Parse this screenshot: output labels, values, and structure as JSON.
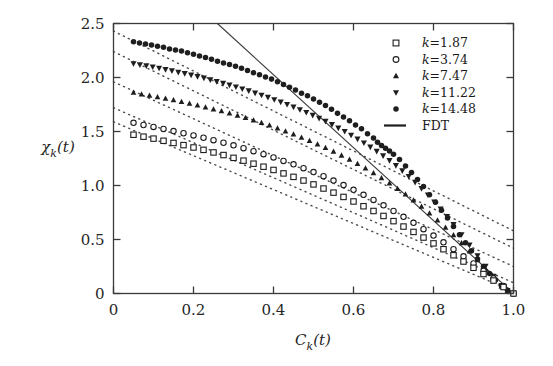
{
  "figure": {
    "background": "#ffffff",
    "ink_color": "#1a1a1a"
  },
  "axes": {
    "x_title": "C",
    "x_title_sub": "k",
    "x_title_tail": "(t)",
    "y_title": "χ",
    "y_title_sub": "k",
    "y_title_tail": "(t)",
    "x_ticks": [
      "0",
      "0.2",
      "0.4",
      "0.6",
      "0.8",
      "1.0"
    ],
    "x_tick_values": [
      0,
      0.2,
      0.4,
      0.6,
      0.8,
      1.0
    ],
    "y_ticks": [
      "0",
      "0.5",
      "1.0",
      "1.5",
      "2.0",
      "2.5"
    ],
    "y_tick_values": [
      0,
      0.5,
      1.0,
      1.5,
      2.0,
      2.5
    ],
    "xlim": [
      0,
      1.0
    ],
    "ylim": [
      0,
      2.5
    ],
    "grid": false
  },
  "legend": {
    "position": "top-right",
    "entries": [
      {
        "label_lhs": "k",
        "label_eq": "=",
        "label_rhs": "1.87",
        "marker": "open-square",
        "k": 1.87
      },
      {
        "label_lhs": "k",
        "label_eq": "=",
        "label_rhs": "3.74",
        "marker": "open-circle",
        "k": 3.74
      },
      {
        "label_lhs": "k",
        "label_eq": "=",
        "label_rhs": "7.47",
        "marker": "filled-triangle-up",
        "k": 7.47
      },
      {
        "label_lhs": "k",
        "label_eq": "=",
        "label_rhs": "11.22",
        "marker": "filled-triangle-down",
        "k": 11.22
      },
      {
        "label_lhs": "k",
        "label_eq": "=",
        "label_rhs": "14.48",
        "marker": "filled-circle",
        "k": 14.48
      },
      {
        "label_lhs": "FDT",
        "label_eq": "",
        "label_rhs": "",
        "marker": "solid-line",
        "k": null
      }
    ]
  },
  "chart_data": {
    "type": "scatter",
    "title": "",
    "xlabel": "C_k(t)",
    "ylabel": "chi_k(t)",
    "xlim": [
      0,
      1.0
    ],
    "ylim": [
      0,
      2.5
    ],
    "grid": false,
    "legend_position": "top-right",
    "fdt_line": {
      "name": "FDT",
      "style": "solid",
      "x": [
        0.2597,
        1.0
      ],
      "y": [
        2.5,
        0.0
      ],
      "slope": -3.38,
      "intercept": 3.38
    },
    "guide_lines": [
      {
        "name": "guide k=14.48",
        "style": "dotted",
        "x": [
          0.0,
          1.0
        ],
        "y": [
          2.43,
          0.58
        ],
        "slope": -1.85
      },
      {
        "name": "guide k=11.22",
        "style": "dotted",
        "x": [
          0.0,
          1.0
        ],
        "y": [
          2.24,
          0.42
        ],
        "slope": -1.82
      },
      {
        "name": "guide k=7.47",
        "style": "dotted",
        "x": [
          0.0,
          1.0
        ],
        "y": [
          1.96,
          0.25
        ],
        "slope": -1.71
      },
      {
        "name": "guide k=3.74",
        "style": "dotted",
        "x": [
          0.0,
          1.0
        ],
        "y": [
          1.72,
          0.1
        ],
        "slope": -1.62
      },
      {
        "name": "guide k=1.87",
        "style": "dotted",
        "x": [
          0.0,
          1.0
        ],
        "y": [
          1.59,
          0.02
        ],
        "slope": -1.57
      }
    ],
    "series": [
      {
        "name": "k = 14.48",
        "marker": "filled-circle",
        "k": 14.48,
        "x": [
          0.05,
          0.065,
          0.08,
          0.095,
          0.11,
          0.125,
          0.14,
          0.155,
          0.17,
          0.185,
          0.2,
          0.215,
          0.23,
          0.245,
          0.26,
          0.275,
          0.29,
          0.305,
          0.32,
          0.335,
          0.35,
          0.365,
          0.38,
          0.395,
          0.41,
          0.425,
          0.44,
          0.455,
          0.47,
          0.485,
          0.5,
          0.515,
          0.53,
          0.545,
          0.56,
          0.575,
          0.59,
          0.605,
          0.62,
          0.635,
          0.65,
          0.66,
          0.67,
          0.68,
          0.69,
          0.7,
          0.715,
          0.73,
          0.745,
          0.76,
          0.775,
          0.79,
          0.805,
          0.82,
          0.835,
          0.85,
          0.865,
          0.88,
          0.895,
          0.91,
          0.925,
          0.94,
          0.955,
          0.97,
          0.985,
          1.0
        ],
        "y": [
          2.33,
          2.32,
          2.31,
          2.3,
          2.29,
          2.28,
          2.265,
          2.255,
          2.245,
          2.23,
          2.215,
          2.2,
          2.185,
          2.17,
          2.15,
          2.135,
          2.12,
          2.105,
          2.085,
          2.065,
          2.045,
          2.025,
          2.005,
          1.985,
          1.96,
          1.935,
          1.91,
          1.885,
          1.855,
          1.83,
          1.8,
          1.77,
          1.74,
          1.705,
          1.67,
          1.635,
          1.6,
          1.56,
          1.525,
          1.48,
          1.44,
          1.4,
          1.37,
          1.345,
          1.32,
          1.29,
          1.24,
          1.18,
          1.12,
          1.055,
          0.99,
          0.915,
          0.845,
          0.77,
          0.7,
          0.62,
          0.545,
          0.47,
          0.395,
          0.32,
          0.25,
          0.185,
          0.125,
          0.07,
          0.03,
          0.0
        ]
      },
      {
        "name": "k = 11.22",
        "marker": "filled-triangle-down",
        "k": 11.22,
        "x": [
          0.05,
          0.066,
          0.082,
          0.098,
          0.114,
          0.13,
          0.146,
          0.162,
          0.178,
          0.194,
          0.21,
          0.226,
          0.242,
          0.258,
          0.274,
          0.29,
          0.306,
          0.322,
          0.338,
          0.354,
          0.37,
          0.386,
          0.402,
          0.418,
          0.434,
          0.45,
          0.466,
          0.482,
          0.498,
          0.514,
          0.53,
          0.546,
          0.562,
          0.578,
          0.594,
          0.61,
          0.626,
          0.642,
          0.658,
          0.674,
          0.69,
          0.706,
          0.722,
          0.738,
          0.754,
          0.77,
          0.786,
          0.802,
          0.818,
          0.834,
          0.85,
          0.87,
          0.89,
          0.91,
          0.93,
          0.95,
          0.97,
          0.985,
          1.0
        ],
        "y": [
          2.13,
          2.12,
          2.11,
          2.1,
          2.088,
          2.076,
          2.064,
          2.05,
          2.038,
          2.024,
          2.01,
          1.996,
          1.98,
          1.964,
          1.948,
          1.932,
          1.914,
          1.896,
          1.878,
          1.858,
          1.838,
          1.818,
          1.796,
          1.774,
          1.752,
          1.728,
          1.704,
          1.678,
          1.652,
          1.624,
          1.596,
          1.566,
          1.534,
          1.502,
          1.468,
          1.432,
          1.396,
          1.358,
          1.318,
          1.276,
          1.232,
          1.186,
          1.138,
          1.086,
          1.032,
          0.974,
          0.914,
          0.85,
          0.784,
          0.714,
          0.64,
          0.546,
          0.45,
          0.352,
          0.254,
          0.162,
          0.076,
          0.03,
          0.0
        ]
      },
      {
        "name": "k = 7.47",
        "marker": "filled-triangle-up",
        "k": 7.47,
        "x": [
          0.05,
          0.07,
          0.09,
          0.11,
          0.13,
          0.15,
          0.17,
          0.19,
          0.21,
          0.23,
          0.25,
          0.27,
          0.29,
          0.31,
          0.33,
          0.35,
          0.37,
          0.39,
          0.41,
          0.43,
          0.45,
          0.47,
          0.49,
          0.51,
          0.53,
          0.55,
          0.57,
          0.59,
          0.61,
          0.63,
          0.65,
          0.67,
          0.69,
          0.71,
          0.73,
          0.75,
          0.77,
          0.79,
          0.81,
          0.83,
          0.85,
          0.87,
          0.89,
          0.91,
          0.93,
          0.95,
          0.97,
          0.985,
          1.0
        ],
        "y": [
          1.86,
          1.845,
          1.832,
          1.818,
          1.804,
          1.79,
          1.774,
          1.758,
          1.742,
          1.724,
          1.706,
          1.688,
          1.668,
          1.648,
          1.626,
          1.604,
          1.58,
          1.556,
          1.53,
          1.502,
          1.474,
          1.444,
          1.414,
          1.382,
          1.348,
          1.314,
          1.278,
          1.24,
          1.2,
          1.158,
          1.114,
          1.068,
          1.02,
          0.97,
          0.918,
          0.862,
          0.804,
          0.742,
          0.678,
          0.61,
          0.54,
          0.466,
          0.39,
          0.31,
          0.228,
          0.146,
          0.064,
          0.025,
          0.0
        ]
      },
      {
        "name": "k = 3.74",
        "marker": "open-circle",
        "k": 3.74,
        "x": [
          0.05,
          0.075,
          0.1,
          0.125,
          0.15,
          0.175,
          0.2,
          0.225,
          0.25,
          0.275,
          0.3,
          0.325,
          0.35,
          0.375,
          0.4,
          0.425,
          0.45,
          0.475,
          0.5,
          0.525,
          0.55,
          0.575,
          0.6,
          0.625,
          0.65,
          0.675,
          0.7,
          0.725,
          0.75,
          0.775,
          0.8,
          0.825,
          0.85,
          0.875,
          0.9,
          0.925,
          0.95,
          0.975,
          1.0
        ],
        "y": [
          1.58,
          1.56,
          1.542,
          1.524,
          1.504,
          1.484,
          1.464,
          1.442,
          1.42,
          1.396,
          1.372,
          1.346,
          1.318,
          1.29,
          1.26,
          1.228,
          1.196,
          1.16,
          1.124,
          1.086,
          1.046,
          1.004,
          0.96,
          0.914,
          0.866,
          0.816,
          0.764,
          0.71,
          0.654,
          0.596,
          0.536,
          0.474,
          0.41,
          0.344,
          0.278,
          0.21,
          0.14,
          0.07,
          0.0
        ]
      },
      {
        "name": "k = 1.87",
        "marker": "open-square",
        "k": 1.87,
        "x": [
          0.05,
          0.075,
          0.1,
          0.125,
          0.15,
          0.175,
          0.2,
          0.225,
          0.25,
          0.275,
          0.3,
          0.325,
          0.35,
          0.375,
          0.4,
          0.425,
          0.45,
          0.475,
          0.5,
          0.525,
          0.55,
          0.575,
          0.6,
          0.625,
          0.65,
          0.675,
          0.7,
          0.725,
          0.75,
          0.775,
          0.8,
          0.825,
          0.85,
          0.875,
          0.9,
          0.925,
          0.95,
          0.975,
          1.0
        ],
        "y": [
          1.47,
          1.452,
          1.434,
          1.414,
          1.394,
          1.374,
          1.352,
          1.33,
          1.306,
          1.282,
          1.256,
          1.23,
          1.202,
          1.174,
          1.144,
          1.112,
          1.08,
          1.046,
          1.01,
          0.972,
          0.934,
          0.894,
          0.852,
          0.808,
          0.764,
          0.718,
          0.67,
          0.62,
          0.57,
          0.518,
          0.464,
          0.41,
          0.354,
          0.296,
          0.238,
          0.18,
          0.12,
          0.06,
          0.0
        ]
      }
    ]
  }
}
